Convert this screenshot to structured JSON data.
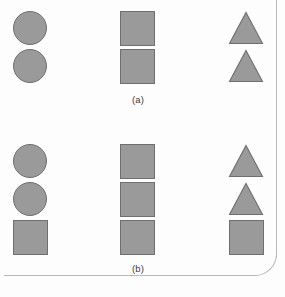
{
  "figure": {
    "background_color": "#fdfdfd",
    "shape_fill_color": "#9a9a9a",
    "shape_stroke_color": "#6f6f6f",
    "edge_line_color": "#b9b9b9",
    "groups": [
      {
        "caption": "(a)",
        "columns": [
          {
            "shapes": [
              "circle",
              "circle"
            ]
          },
          {
            "shapes": [
              "square",
              "square"
            ]
          },
          {
            "shapes": [
              "triangle",
              "triangle"
            ]
          }
        ]
      },
      {
        "caption": "(b)",
        "columns": [
          {
            "shapes": [
              "circle",
              "circle",
              "square"
            ]
          },
          {
            "shapes": [
              "square",
              "square",
              "square"
            ]
          },
          {
            "shapes": [
              "triangle",
              "triangle",
              "square"
            ]
          }
        ]
      }
    ]
  }
}
